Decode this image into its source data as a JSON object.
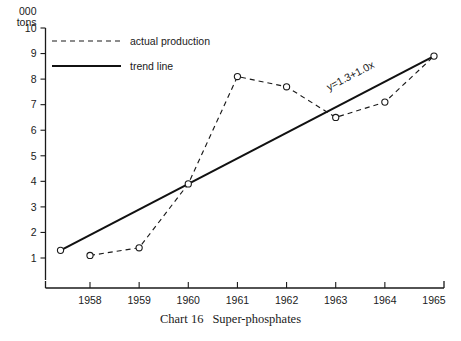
{
  "caption": {
    "chart_label": "Chart 16",
    "title": "Super-phosphates"
  },
  "axis": {
    "y_unit_line1": "000",
    "y_unit_line2": "tons"
  },
  "legend": {
    "items": [
      {
        "label": "actual production",
        "style": "dashed"
      },
      {
        "label": "trend line",
        "style": "solid"
      }
    ]
  },
  "annotation": {
    "equation": "y=1.3+1.0x"
  },
  "colors": {
    "ink": "#1a1a1a",
    "background": "#ffffff"
  },
  "chart_data": {
    "type": "line",
    "title": "Super-phosphates",
    "xlabel": "",
    "ylabel": "000 tons",
    "xlim": [
      1957.4,
      1965.0
    ],
    "ylim": [
      0,
      10
    ],
    "grid": false,
    "legend_position": "top-left",
    "x": [
      1958,
      1959,
      1960,
      1961,
      1962,
      1963,
      1964,
      1965
    ],
    "xtick_labels": [
      "1958",
      "1959",
      "1960",
      "1961",
      "1962",
      "1963",
      "1964",
      "1965"
    ],
    "ytick_labels": [
      "1",
      "2",
      "3",
      "4",
      "5",
      "6",
      "7",
      "8",
      "9",
      "10"
    ],
    "yticks": [
      1,
      2,
      3,
      4,
      5,
      6,
      7,
      8,
      9,
      10
    ],
    "series": [
      {
        "name": "actual production",
        "style": "dashed",
        "marker": "open-circle",
        "values": [
          1.1,
          1.4,
          3.9,
          8.1,
          7.7,
          6.5,
          7.1,
          8.9
        ]
      },
      {
        "name": "trend line",
        "style": "solid",
        "marker": "none",
        "equation": "y=1.3+1.0x",
        "x_endpoints": [
          1957.4,
          1965
        ],
        "value_endpoints": [
          1.3,
          8.9
        ]
      }
    ]
  }
}
